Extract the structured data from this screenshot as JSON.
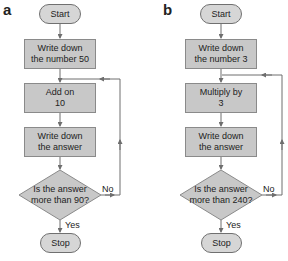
{
  "diagrams": [
    {
      "label": "a",
      "start": "Start",
      "step1": {
        "line1": "Write down",
        "line2": "the number 50"
      },
      "step2": {
        "line1": "Add on",
        "line2": "10"
      },
      "step3": {
        "line1": "Write down",
        "line2": "the answer"
      },
      "decision": {
        "line1": "Is the answer",
        "line2": "more than 90?"
      },
      "no_label": "No",
      "yes_label": "Yes",
      "stop": "Stop"
    },
    {
      "label": "b",
      "start": "Start",
      "step1": {
        "line1": "Write down",
        "line2": "the number 3"
      },
      "step2": {
        "line1": "Multiply by",
        "line2": "3"
      },
      "step3": {
        "line1": "Write down",
        "line2": "the answer"
      },
      "decision": {
        "line1": "Is the answer",
        "line2": "more than 240?"
      },
      "no_label": "No",
      "yes_label": "Yes",
      "stop": "Stop"
    }
  ],
  "colors": {
    "box_fill": "#c8c8c8",
    "terminal_fill": "#d6d6d6",
    "line": "#6e6e6e"
  }
}
